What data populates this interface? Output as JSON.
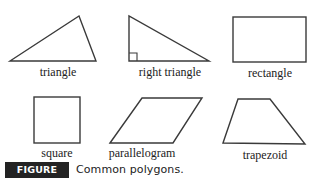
{
  "figure": {
    "shapes": [
      {
        "id": "triangle",
        "label": "triangle"
      },
      {
        "id": "right-triangle",
        "label": "right triangle"
      },
      {
        "id": "rectangle",
        "label": "rectangle"
      },
      {
        "id": "square",
        "label": "square"
      },
      {
        "id": "parallelogram",
        "label": "parallelogram"
      },
      {
        "id": "trapezoid",
        "label": "trapezoid"
      }
    ],
    "caption": {
      "badge": "FIGURE 8.1",
      "text": "Common polygons."
    },
    "colors": {
      "stroke": "#3a3a3a",
      "badge_bg": "#232323",
      "badge_text": "#ffffff"
    }
  }
}
